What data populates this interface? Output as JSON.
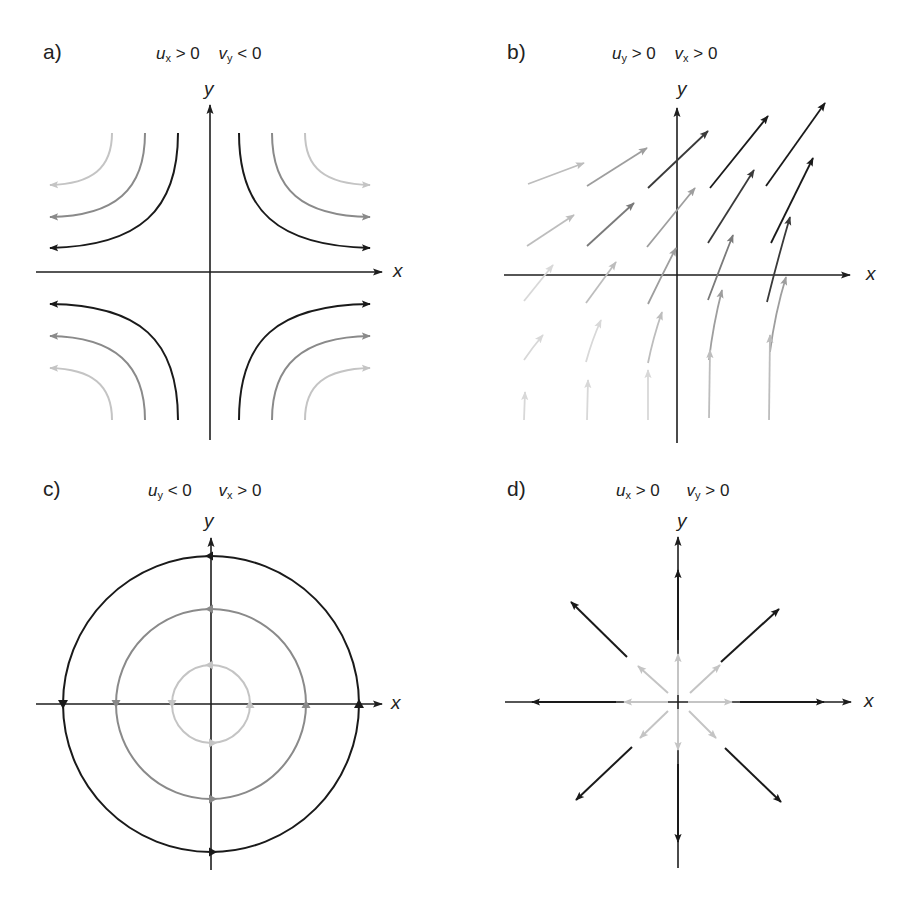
{
  "colors": {
    "axis": "#1e1e1e",
    "dark": "#1a1a1a",
    "mid": "#8a8a8a",
    "light": "#c4c4c4",
    "b_shades": [
      "#d8d8d8",
      "#bdbdbd",
      "#9e9e9e",
      "#7a7a7a",
      "#3a3a3a",
      "#1a1a1a"
    ]
  },
  "panels": {
    "a": {
      "label": "a)",
      "condition1": {
        "var": "u",
        "sub": "x",
        "rel": "> 0"
      },
      "condition2": {
        "var": "v",
        "sub": "y",
        "rel": "< 0"
      },
      "x_label": "x",
      "y_label": "y",
      "description": "Hyperbolic strain flow: streamlines come in along y and leave along x"
    },
    "b": {
      "label": "b)",
      "condition1": {
        "var": "u",
        "sub": "y",
        "rel": "> 0"
      },
      "condition2": {
        "var": "v",
        "sub": "x",
        "rel": "> 0"
      },
      "x_label": "x",
      "y_label": "y",
      "description": "Shear field: vectors rotate from vertical (left/bottom) toward diagonal (upper right), increasing in magnitude"
    },
    "c": {
      "label": "c)",
      "condition1": {
        "var": "u",
        "sub": "y",
        "rel": "< 0"
      },
      "condition2": {
        "var": "v",
        "sub": "x",
        "rel": "> 0"
      },
      "x_label": "x",
      "y_label": "y",
      "description": "Rotation: concentric circular streamlines, counter-clockwise",
      "circles": [
        {
          "r": 39,
          "shade": "light"
        },
        {
          "r": 95,
          "shade": "mid"
        },
        {
          "r": 148,
          "shade": "dark"
        }
      ]
    },
    "d": {
      "label": "d)",
      "condition1": {
        "var": "u",
        "sub": "x",
        "rel": "> 0"
      },
      "condition2": {
        "var": "v",
        "sub": "y",
        "rel": "> 0"
      },
      "x_label": "x",
      "y_label": "y",
      "description": "Divergence: radial vectors pointing outward in 8 directions"
    }
  }
}
